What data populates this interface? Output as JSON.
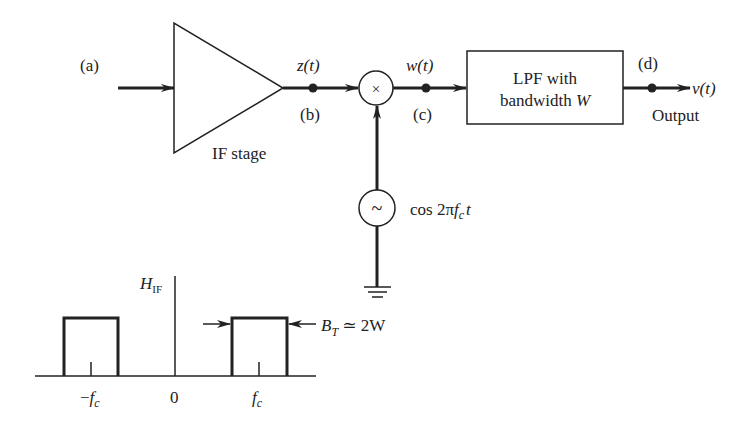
{
  "diagram": {
    "input_label": "(a)",
    "if_stage_label": "IF stage",
    "node_b": {
      "signal": "z(t)",
      "label": "(b)"
    },
    "node_c": {
      "signal": "w(t)",
      "label": "(c)"
    },
    "node_d": {
      "signal": "v(t)",
      "label": "(d)"
    },
    "multiplier_symbol": "×",
    "lpf": {
      "line1": "LPF with",
      "line2_prefix": "bandwidth ",
      "line2_var": "W"
    },
    "output_label": "Output",
    "oscillator": {
      "symbol": "~",
      "signal_prefix": "cos 2π",
      "signal_f": "f",
      "signal_sub": "c",
      "signal_t": "t"
    },
    "spectrum": {
      "y_label_main": "H",
      "y_label_sub": "IF",
      "x_ticks": [
        {
          "pre": "−",
          "main": "f",
          "sub": "c"
        },
        {
          "pre": "",
          "main": "0",
          "sub": ""
        },
        {
          "pre": "",
          "main": "f",
          "sub": "c"
        }
      ],
      "bandwidth_label_main": "B",
      "bandwidth_label_sub": "T",
      "bandwidth_label_rest": " ≃ 2W"
    }
  }
}
